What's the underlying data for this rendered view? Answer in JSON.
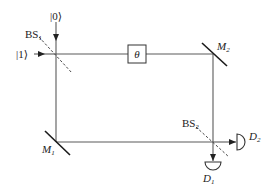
{
  "diagram": {
    "inputs": {
      "top": "|0⟩",
      "left": "|1⟩"
    },
    "phase_shifter": {
      "label": "θ"
    },
    "beam_splitters": [
      {
        "label": "BS",
        "sub": "1"
      },
      {
        "label": "BS",
        "sub": "2"
      }
    ],
    "mirrors": [
      {
        "label": "M",
        "sub": "1"
      },
      {
        "label": "M",
        "sub": "2"
      }
    ],
    "detectors": [
      {
        "label": "D",
        "sub": "1"
      },
      {
        "label": "D",
        "sub": "2"
      }
    ]
  }
}
